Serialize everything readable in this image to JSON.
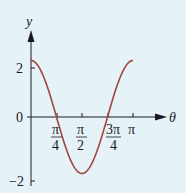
{
  "chart_data": {
    "type": "line",
    "title": "",
    "xlabel": "θ",
    "ylabel": "y",
    "function": "y = 2cos(2θ)",
    "xlim": [
      0,
      3.14159
    ],
    "ylim": [
      -2,
      2
    ],
    "x_ticks": [
      "π/4",
      "π/2",
      "3π/4",
      "π"
    ],
    "y_ticks": [
      "2",
      "0",
      "−2"
    ],
    "grid": false,
    "legend": null,
    "series": [
      {
        "name": "y = 2cos 2θ",
        "color": "#a0463a",
        "x": [
          0,
          0.3927,
          0.7854,
          1.1781,
          1.5708,
          1.9635,
          2.3562,
          2.7489,
          3.1416
        ],
        "y": [
          2,
          1.414,
          0,
          -1.414,
          -2,
          -1.414,
          0,
          1.414,
          2
        ]
      }
    ]
  },
  "labels": {
    "y_axis": "y",
    "x_axis": "θ",
    "y_tick_2": "2",
    "y_tick_0": "0",
    "y_tick_neg2": "−2",
    "x_tick_pi4_num": "π",
    "x_tick_pi4_den": "4",
    "x_tick_pi2_num": "π",
    "x_tick_pi2_den": "2",
    "x_tick_3pi4_num": "3π",
    "x_tick_3pi4_den": "4",
    "x_tick_pi": "π"
  },
  "colors": {
    "background": "#e5f2f8",
    "axis": "#1a1a1a",
    "curve": "#a0463a"
  }
}
